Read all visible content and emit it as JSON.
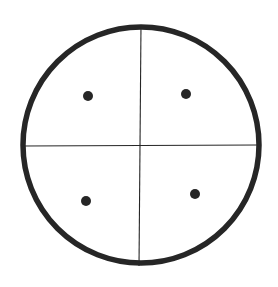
{
  "diagram": {
    "type": "quadrant-circle",
    "background": "#ffffff",
    "ink_color": "#262626",
    "circle": {
      "cx": 141,
      "cy": 145,
      "r": 118,
      "stroke_width": 5.5
    },
    "vertical_divider": {
      "x1": 141,
      "y1": 25,
      "x2": 139,
      "y2": 266,
      "stroke_width": 1.1
    },
    "horizontal_divider": {
      "x1": 23,
      "y1": 146,
      "x2": 258,
      "y2": 145,
      "stroke_width": 1.1
    },
    "dots": [
      {
        "quadrant": "top-left",
        "cx": 88,
        "cy": 96,
        "r": 5
      },
      {
        "quadrant": "top-right",
        "cx": 186,
        "cy": 94,
        "r": 5
      },
      {
        "quadrant": "bottom-left",
        "cx": 86,
        "cy": 201,
        "r": 5
      },
      {
        "quadrant": "bottom-right",
        "cx": 195,
        "cy": 194,
        "r": 5
      }
    ]
  }
}
